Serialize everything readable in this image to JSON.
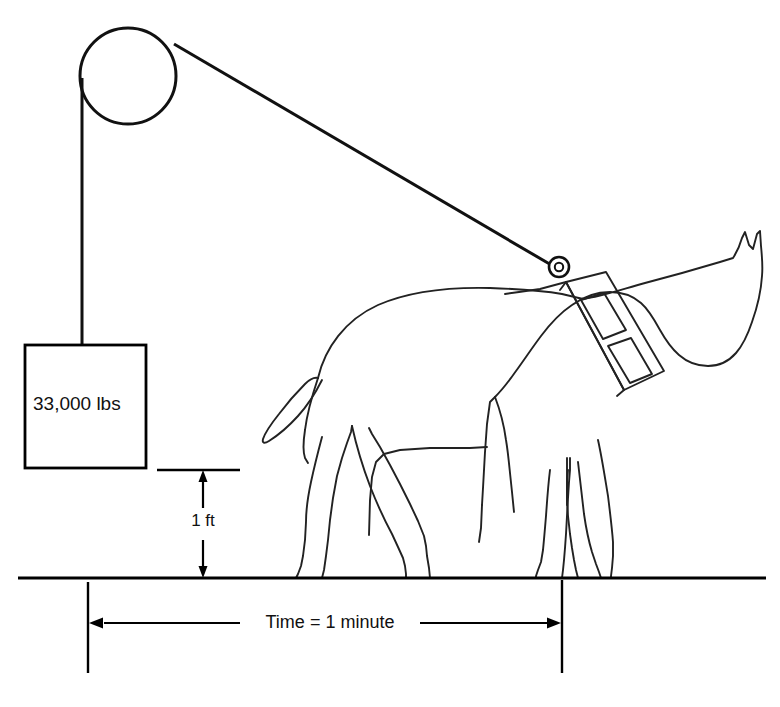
{
  "figure": {
    "background_color": "#ffffff",
    "line_color": "#111111",
    "width": 780,
    "height": 707
  },
  "labels": {
    "weight_label": "33,000 lbs",
    "height_label": "1 ft",
    "time_label": "Time = 1 minute"
  },
  "elements": {
    "pulley_name": "pulley-wheel",
    "rope_vertical_name": "rope-vertical-segment",
    "rope_diagonal_name": "rope-diagonal-segment",
    "weight_box_name": "weight-box",
    "horse_name": "horse-figure",
    "harness_name": "horse-harness-collar",
    "harness_ring_name": "harness-attachment-ring",
    "ground_name": "ground-line"
  },
  "dimensions": {
    "height_value": 1,
    "height_unit": "ft",
    "weight_value": 33000,
    "weight_unit": "lbs",
    "time_value": 1,
    "time_unit": "minute"
  }
}
